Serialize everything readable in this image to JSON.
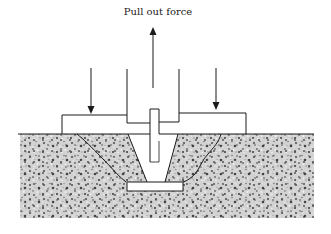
{
  "diagram": {
    "title_label": "Pull out force",
    "elements": [
      {
        "name": "pull-out-force-arrow",
        "direction": "up"
      },
      {
        "name": "left-load-arrow",
        "direction": "down"
      },
      {
        "name": "right-load-arrow",
        "direction": "down"
      },
      {
        "name": "test-rig-frame"
      },
      {
        "name": "reaction-plate"
      },
      {
        "name": "anchor-bolt"
      },
      {
        "name": "anchor-head-plate"
      },
      {
        "name": "concrete-cone-failure"
      },
      {
        "name": "concrete-substrate"
      }
    ],
    "colors": {
      "line": "#1a1a1a",
      "concrete_base": "#c8c8c8",
      "background": "#ffffff"
    }
  }
}
